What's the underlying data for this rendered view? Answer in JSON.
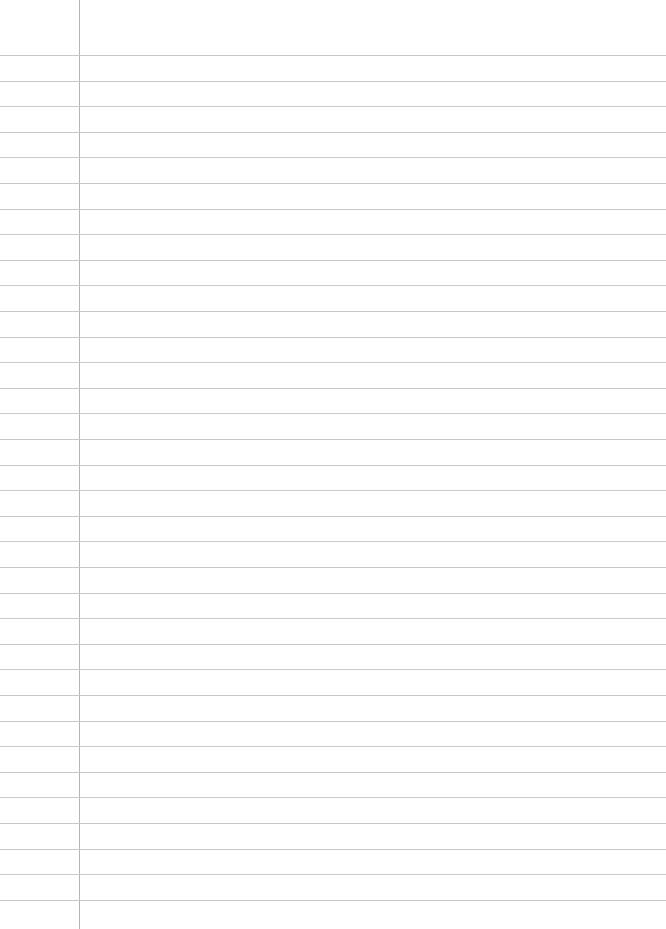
{
  "page": {
    "type": "blank lined paper",
    "line_count": 34,
    "first_line_y": 55,
    "line_spacing": 25.6,
    "margin_x": 79,
    "colors": {
      "background": "#ffffff",
      "rule": "#c8c8c8",
      "margin": "#b4b4b4"
    }
  }
}
